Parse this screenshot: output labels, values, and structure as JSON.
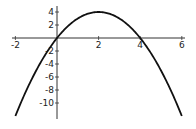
{
  "chart_data": {
    "type": "line",
    "title": "",
    "xlabel": "",
    "ylabel": "",
    "function": "y = 4x - x^2",
    "xlim": [
      -2,
      6
    ],
    "ylim": [
      -12,
      4.2
    ],
    "grid": false,
    "legend": null,
    "x_ticks": [
      -2,
      2,
      4,
      6
    ],
    "x_tick_labels": [
      "-2",
      "2",
      "4",
      "6"
    ],
    "y_ticks": [
      4,
      2,
      -2,
      -4,
      -6,
      -8,
      -10
    ],
    "y_tick_labels": [
      "4",
      "2",
      "-2",
      "-4",
      "-6",
      "-8",
      "-10"
    ],
    "series": [
      {
        "name": "parabola",
        "x": [
          -2,
          -1.5,
          -1,
          -0.5,
          0,
          0.5,
          1,
          1.5,
          2,
          2.5,
          3,
          3.5,
          4,
          4.5,
          5,
          5.5,
          6
        ],
        "y": [
          -12,
          -8.25,
          -5,
          -2.25,
          0,
          1.75,
          3,
          3.75,
          4,
          3.75,
          3,
          1.75,
          0,
          -2.25,
          -5,
          -8.25,
          -12
        ]
      }
    ],
    "color": "#111111"
  }
}
